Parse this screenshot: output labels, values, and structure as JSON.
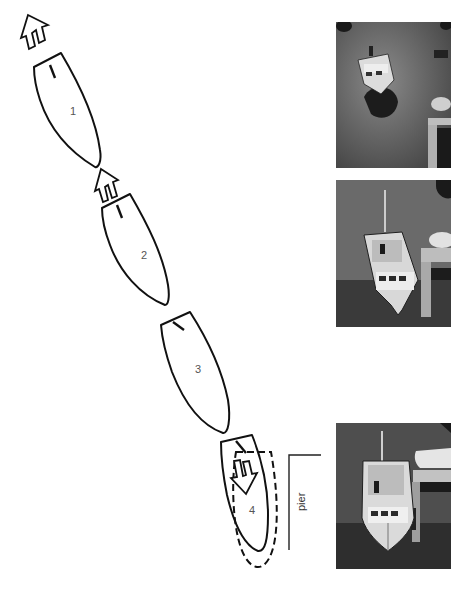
{
  "figure": {
    "positions": [
      {
        "label": "1",
        "arrow": "forward"
      },
      {
        "label": "2",
        "arrow": "forward"
      },
      {
        "label": "3",
        "arrow": "none"
      },
      {
        "label": "4",
        "arrow": "reverse",
        "final_position": "dashed"
      }
    ],
    "pier_label": "pier",
    "photos": [
      {
        "name": "photo-boat-approaching",
        "caption_alt": "Boat approaching in open water near pier"
      },
      {
        "name": "photo-boat-near-pier",
        "caption_alt": "Boat angled next to pier"
      },
      {
        "name": "photo-boat-docked",
        "caption_alt": "Boat docked alongside pier"
      }
    ]
  },
  "colors": {
    "line": "#111111",
    "background": "#ffffff",
    "photo_water": "#5a5a5a"
  }
}
